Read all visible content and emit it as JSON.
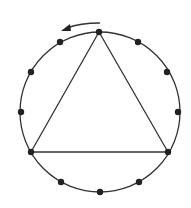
{
  "diagram": {
    "circle": {
      "cx": 100,
      "cy": 112,
      "r": 80
    },
    "point_count": 12,
    "triangle_vertices": [
      0,
      4,
      8
    ],
    "rotation_direction": "counterclockwise",
    "colors": {
      "stroke": "#333333",
      "point": "#222222",
      "background": "#ffffff"
    }
  }
}
